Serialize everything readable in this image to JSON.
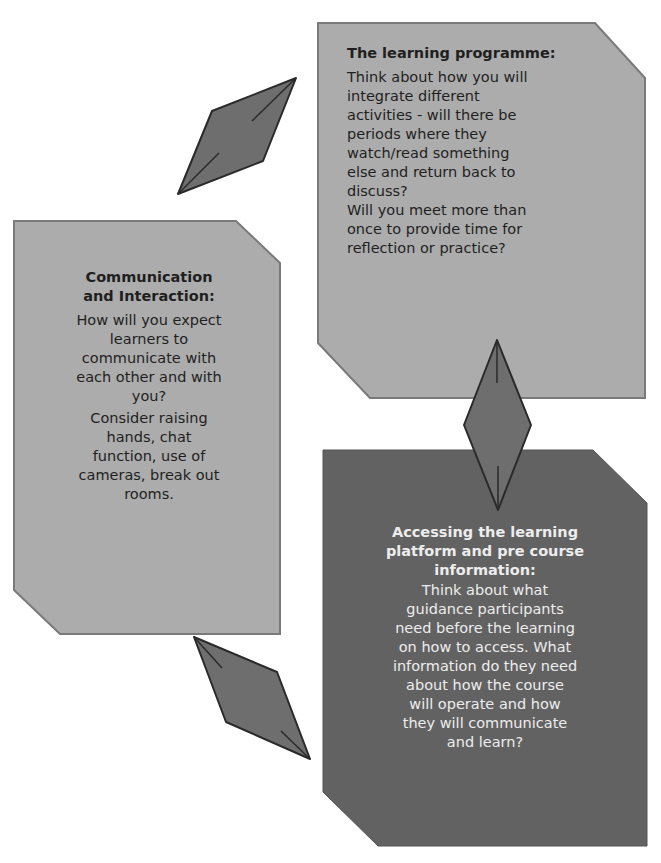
{
  "colors": {
    "light_box": "#acacac",
    "dark_box": "#626262",
    "connector": "#6e6e6e",
    "outline": "#2a2a2a",
    "background": "#ffffff"
  },
  "boxes": {
    "learning_programme": {
      "title": "The learning programme:",
      "paragraphs": [
        "Think about how you will\nintegrate different\nactivities - will there be\nperiods where they\nwatch/read something\nelse and return back to\ndiscuss?\nWill you meet more than\nonce to provide time for\nreflection or practice?"
      ]
    },
    "communication": {
      "title": "Communication\nand Interaction:",
      "paragraphs": [
        "How will you expect\nlearners to\ncommunicate with\neach other and with\nyou?",
        "Consider raising\nhands, chat\nfunction, use of\ncameras, break out\nrooms."
      ]
    },
    "accessing_platform": {
      "title": "Accessing the learning\nplatform and pre course\ninformation:",
      "paragraphs": [
        "Think about what\nguidance participants\nneed before the learning\non how to access. What\ninformation do they need\nabout how the course\nwill operate and how\nthey will communicate\nand learn?"
      ]
    }
  },
  "connectors": [
    {
      "name": "left-to-top",
      "icon": "diamond-connector-icon"
    },
    {
      "name": "top-to-bottom",
      "icon": "diamond-connector-icon"
    },
    {
      "name": "bottom-to-left",
      "icon": "diamond-connector-icon"
    }
  ]
}
